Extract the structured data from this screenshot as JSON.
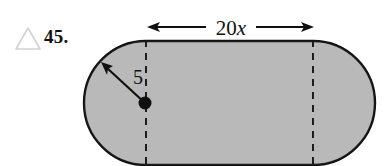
{
  "figure": {
    "exercise_number": "45.",
    "marker_icon": "triangle-outline-icon",
    "marker_color": "#cfcfcf",
    "shape": {
      "name": "stadium-rounded-rectangle",
      "fill_color": "#b6b6b6",
      "stroke_color": "#111111"
    },
    "dimension_top": {
      "label_number": "20",
      "label_variable": "x",
      "arrow_style": "double-headed"
    },
    "radius": {
      "label": "5",
      "arrow_style": "single-headed",
      "center_marker": "filled-dot"
    },
    "dashed_lines": {
      "count": 2,
      "style": "dashed",
      "color": "#111111"
    }
  }
}
